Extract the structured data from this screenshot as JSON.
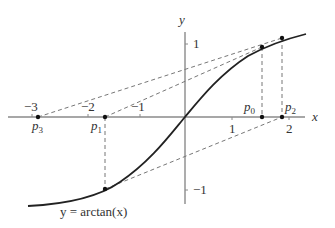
{
  "diagram": {
    "axes": {
      "x_label": "x",
      "y_label": "y",
      "x_ticks": [
        "-3",
        "-2",
        "-1",
        "1",
        "2"
      ],
      "y_ticks": [
        "1",
        "-1"
      ],
      "x_tick_display": [
        "−3",
        "−2",
        "−1",
        "1",
        "2"
      ],
      "y_tick_display": [
        "1",
        "−1"
      ]
    },
    "curve": {
      "label": "y = arctan(x)",
      "function": "arctan"
    },
    "points": [
      {
        "name": "p0",
        "sub": "0",
        "x": 1.39
      },
      {
        "name": "p1",
        "sub": "1",
        "x": -1.69
      },
      {
        "name": "p2",
        "sub": "2",
        "x": 2.32
      },
      {
        "name": "p3",
        "sub": "3",
        "x": -5.11
      }
    ],
    "labels": {
      "p0": "p",
      "p0_sub": "0",
      "p1": "p",
      "p1_sub": "1",
      "p2": "p",
      "p2_sub": "2",
      "p3": "p",
      "p3_sub": "3",
      "curve_label": "y = arctan(x)"
    },
    "colors": {
      "axis": "#888888",
      "curve": "#222222",
      "dashed": "#777777",
      "text": "#333333"
    }
  }
}
